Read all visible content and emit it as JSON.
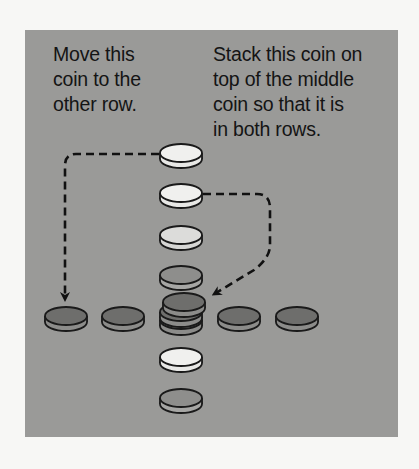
{
  "instructions": {
    "left": "Move this\ncoin to the\nother row.",
    "right": "Stack this coin on\ntop of the middle\ncoin so that it is\nin both rows."
  },
  "colors": {
    "panel": "#9a9a98",
    "coin_light": "#eeeeec",
    "coin_mid": "#d8d8d6",
    "coin_dark": "#6f6f6d",
    "coin_gray": "#8a8a88"
  },
  "puzzle": {
    "horizontal_row": [
      "dark",
      "dark",
      "dark-stacked",
      "dark",
      "dark"
    ],
    "vertical_column": [
      "light",
      "light",
      "light",
      "gray",
      "dark-stacked",
      "light",
      "gray"
    ]
  }
}
